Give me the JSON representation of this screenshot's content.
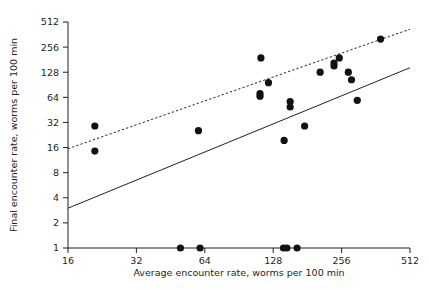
{
  "chart_data": {
    "type": "scatter",
    "title": "",
    "xlabel": "Average encounter rate, worms per 100 min",
    "ylabel": "Final encounter rate, worms per 100 min",
    "xscale": "log2",
    "yscale": "log2",
    "xlim": [
      16,
      512
    ],
    "ylim": [
      1,
      512
    ],
    "xticks": [
      16,
      32,
      64,
      128,
      256,
      512
    ],
    "xtick_labels": [
      "16",
      "32",
      "64",
      "128",
      "256",
      "512"
    ],
    "yticks": [
      1,
      2,
      4,
      8,
      16,
      32,
      64,
      128,
      256,
      512
    ],
    "ytick_labels": [
      "1",
      "2",
      "4",
      "8",
      "16",
      "32",
      "64",
      "128",
      "256",
      "512"
    ],
    "grid": false,
    "legend": "none",
    "marker": "filled-circle",
    "marker_color": "#111111",
    "points": [
      {
        "x": 21.0,
        "y": 29.0
      },
      {
        "x": 21.0,
        "y": 14.5
      },
      {
        "x": 60.0,
        "y": 25.5
      },
      {
        "x": 113.0,
        "y": 190.0
      },
      {
        "x": 112.0,
        "y": 71.0
      },
      {
        "x": 112.0,
        "y": 66.0
      },
      {
        "x": 122.0,
        "y": 96.0
      },
      {
        "x": 143.0,
        "y": 19.5
      },
      {
        "x": 152.0,
        "y": 57.0
      },
      {
        "x": 152.0,
        "y": 49.0
      },
      {
        "x": 176.0,
        "y": 29.0
      },
      {
        "x": 206.0,
        "y": 128.0
      },
      {
        "x": 237.0,
        "y": 165.0
      },
      {
        "x": 237.0,
        "y": 152.0
      },
      {
        "x": 250.0,
        "y": 190.0
      },
      {
        "x": 274.0,
        "y": 128.0
      },
      {
        "x": 283.0,
        "y": 104.0
      },
      {
        "x": 300.0,
        "y": 59.0
      },
      {
        "x": 380.0,
        "y": 320.0
      },
      {
        "x": 50.0,
        "y": 1.0
      },
      {
        "x": 61.0,
        "y": 1.0
      },
      {
        "x": 142.0,
        "y": 1.0
      },
      {
        "x": 147.0,
        "y": 1.0
      },
      {
        "x": 163.0,
        "y": 1.0
      }
    ],
    "lines": [
      {
        "name": "upper-dashed-fit",
        "style": "dashed",
        "color": "#231f20",
        "points": [
          [
            16,
            15.5
          ],
          [
            512,
            420.0
          ]
        ]
      },
      {
        "name": "lower-solid-fit",
        "style": "solid",
        "color": "#231f20",
        "points": [
          [
            16,
            3.0
          ],
          [
            512,
            145.0
          ]
        ]
      }
    ]
  },
  "axes": {
    "x_title": "Average encounter rate, worms per 100 min",
    "y_title": "Final encounter rate, worms per 100 min"
  }
}
